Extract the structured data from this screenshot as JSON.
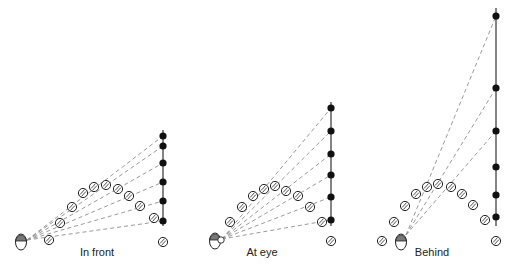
{
  "figure": {
    "colors": {
      "line": "#333333",
      "dash": "#9a9a9a",
      "dot": "#111111",
      "head_cap": "#777777",
      "ball_stroke": "#222222"
    }
  },
  "panels": [
    {
      "label": "In front",
      "label_pos": [
        97,
        257
      ],
      "head": [
        21,
        242
      ],
      "eye": [
        27,
        240
      ],
      "pole": {
        "x": 163,
        "y_top": 130,
        "y_bottom": 226
      },
      "dots": [
        136,
        146,
        163,
        182,
        201,
        221
      ],
      "rays_to": [
        136,
        146,
        163,
        182,
        201,
        221
      ],
      "balls": [
        [
          49,
          240
        ],
        [
          60,
          223
        ],
        [
          72,
          207
        ],
        [
          83,
          193
        ],
        [
          94,
          187
        ],
        [
          106,
          185
        ],
        [
          118,
          189
        ],
        [
          129,
          196
        ],
        [
          140,
          206
        ],
        [
          154,
          218
        ]
      ],
      "ground_ball": [
        163,
        242
      ]
    },
    {
      "label": "At eye",
      "label_pos": [
        262,
        257
      ],
      "head": [
        215,
        241
      ],
      "eye": [
        222,
        239
      ],
      "pole": {
        "x": 331,
        "y_top": 102,
        "y_bottom": 226
      },
      "dots": [
        108,
        131,
        154,
        175,
        197,
        220
      ],
      "rays_to": [
        108,
        131,
        154,
        175,
        197,
        220
      ],
      "balls": [
        [
          230,
          222
        ],
        [
          242,
          207
        ],
        [
          253,
          196
        ],
        [
          264,
          189
        ],
        [
          275,
          186
        ],
        [
          286,
          191
        ],
        [
          298,
          196
        ],
        [
          310,
          207
        ],
        [
          322,
          222
        ]
      ],
      "ground_ball": [
        331,
        241
      ]
    },
    {
      "label": "Behind",
      "label_pos": [
        432,
        257
      ],
      "head": [
        401,
        242
      ],
      "eye": [
        406,
        235
      ],
      "pole": {
        "x": 496,
        "y_top": 8,
        "y_bottom": 226
      },
      "dots": [
        16,
        88,
        131,
        167,
        195,
        217
      ],
      "rays_to": [
        16,
        88,
        131
      ],
      "balls": [
        [
          382,
          241
        ],
        [
          394,
          222
        ],
        [
          405,
          206
        ],
        [
          416,
          194
        ],
        [
          427,
          187
        ],
        [
          438,
          184
        ],
        [
          451,
          187
        ],
        [
          462,
          194
        ],
        [
          473,
          205
        ],
        [
          485,
          220
        ]
      ],
      "ground_ball": [
        496,
        241
      ]
    }
  ]
}
